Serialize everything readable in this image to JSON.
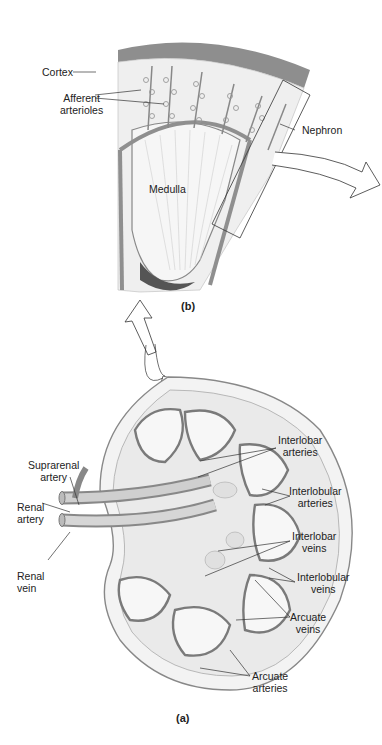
{
  "figure": {
    "panel_b": {
      "label": "(b)",
      "labels": {
        "cortex": "Cortex",
        "afferent_arterioles_1": "Afferent",
        "afferent_arterioles_2": "arterioles",
        "nephron": "Nephron",
        "medulla": "Medulla"
      }
    },
    "panel_a": {
      "label": "(a)",
      "labels": {
        "suprarenal_artery_1": "Suprarenal",
        "suprarenal_artery_2": "artery",
        "renal_artery_1": "Renal",
        "renal_artery_2": "artery",
        "renal_vein_1": "Renal",
        "renal_vein_2": "vein",
        "interlobar_arteries_1": "Interlobar",
        "interlobar_arteries_2": "arteries",
        "interlobular_arteries_1": "Interlobular",
        "interlobular_arteries_2": "arteries",
        "interlobar_veins_1": "Interlobar",
        "interlobar_veins_2": "veins",
        "interlobular_veins_1": "Interlobular",
        "interlobular_veins_2": "veins",
        "arcuate_veins_1": "Arcuate",
        "arcuate_veins_2": "veins",
        "arcuate_arteries_1": "Arcuate",
        "arcuate_arteries_2": "arteries"
      }
    },
    "colors": {
      "capsule": "#8a8a8a",
      "tissue": "#eeeeee",
      "vessel": "#9a9a9a",
      "line": "#333333"
    }
  }
}
